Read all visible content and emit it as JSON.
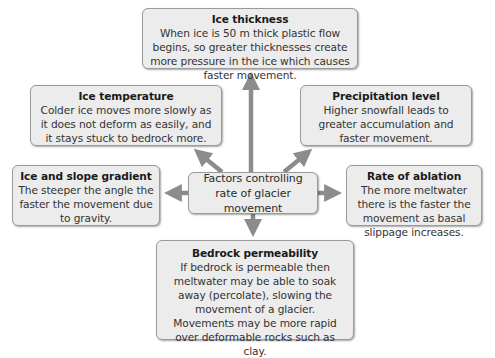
{
  "center": {
    "label": "Factors controlling rate of glacier movement"
  },
  "factors": {
    "ice_thickness": {
      "title": "Ice thickness",
      "body": "When ice is 50 m thick plastic flow begins, so greater thicknesses create more pressure in the ice which causes faster movement."
    },
    "ice_temperature": {
      "title": "Ice temperature",
      "body": "Colder ice moves more slowly as it does not deform as easily, and it stays stuck to bedrock more."
    },
    "precipitation_level": {
      "title": "Precipitation level",
      "body": "Higher snowfall leads to greater accumulation and faster movement."
    },
    "ice_slope_gradient": {
      "title": "Ice and slope gradient",
      "body": "The steeper the angle the faster the movement due to gravity."
    },
    "rate_of_ablation": {
      "title": "Rate of ablation",
      "body": "The more meltwater there is the faster the movement as basal slippage increases."
    },
    "bedrock_permeability": {
      "title": "Bedrock permeability",
      "body": "If bedrock is permeable then meltwater may be able to soak away (percolate), slowing the movement of a glacier. Movements may be more rapid over deformable rocks such as clay."
    }
  },
  "colors": {
    "box_fill": "#ececec",
    "box_border": "#9a9a9a",
    "arrow": "#8c8c8c"
  }
}
